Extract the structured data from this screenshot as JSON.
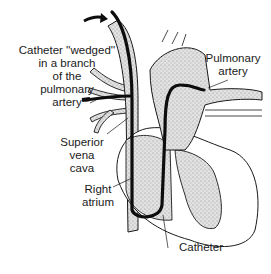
{
  "figure": {
    "labels": {
      "wedged": "Catheter ''wedged''\nin a branch\nof the\npulmonary\nartery",
      "pulmonary_artery": "Pulmonary\nartery",
      "superior_vena_cava": "Superior\nvena\ncava",
      "right_atrium": "Right\natrium",
      "catheter": "Catheter"
    },
    "colors": {
      "outline": "#1a1a1a",
      "stipple": "#d6d6d6",
      "catheter": "#0d0d0d",
      "background": "#ffffff"
    }
  }
}
